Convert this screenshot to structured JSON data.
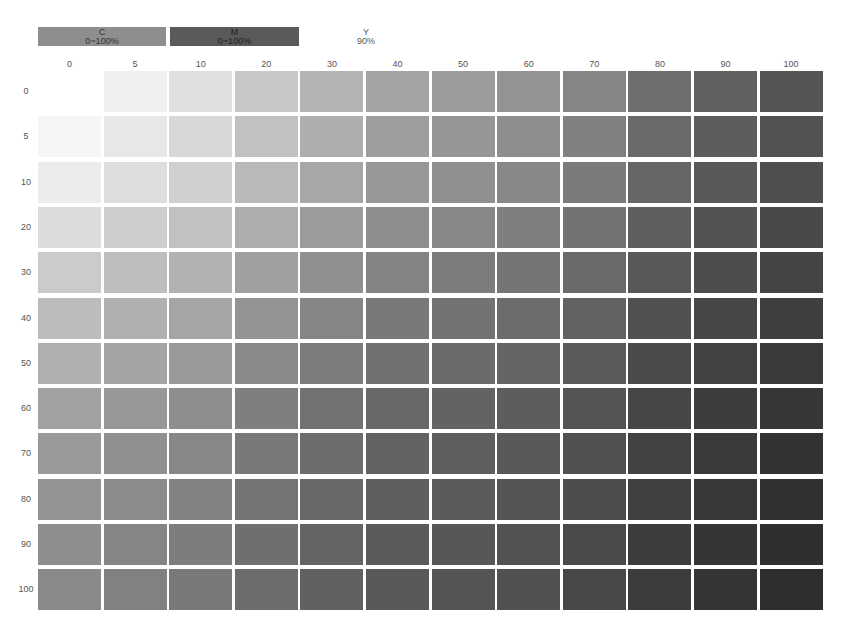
{
  "legend": {
    "c": {
      "letter": "C",
      "range": "0~100%",
      "color": "#8e8e8e"
    },
    "m": {
      "letter": "M",
      "range": "0~100%",
      "color": "#5a5a5a"
    },
    "y": {
      "letter": "Y",
      "value": "90%"
    }
  },
  "chart_data": {
    "type": "heatmap",
    "xlabel": "M (%)",
    "ylabel": "C (%)",
    "x": [
      0,
      5,
      10,
      20,
      30,
      40,
      50,
      60,
      70,
      80,
      90,
      100
    ],
    "y": [
      0,
      5,
      10,
      20,
      30,
      40,
      50,
      60,
      70,
      80,
      90,
      100
    ],
    "fixed": {
      "Y": "90%"
    },
    "top_row_gray": [
      255,
      239,
      224,
      200,
      180,
      164,
      156,
      147,
      133,
      110,
      96,
      85
    ],
    "left_col_gray": [
      255,
      246,
      236,
      220,
      203,
      188,
      175,
      162,
      154,
      148,
      142,
      138
    ],
    "grid": false,
    "legend_position": "top"
  }
}
